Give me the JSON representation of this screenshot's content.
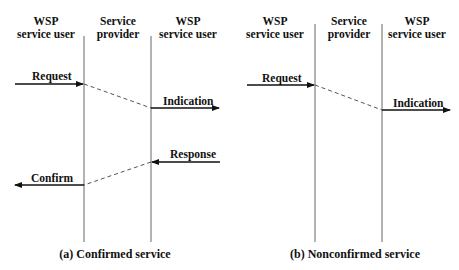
{
  "diagrams": [
    {
      "id": "a",
      "caption": "(a) Confirmed service",
      "columns": [
        {
          "line1": "WSP",
          "line2": "service user"
        },
        {
          "line1": "Service",
          "line2": "provider"
        },
        {
          "line1": "WSP",
          "line2": "service user"
        }
      ],
      "primitives": [
        {
          "label": "Request",
          "direction": "user-to-provider"
        },
        {
          "label": "Indication",
          "direction": "provider-to-user"
        },
        {
          "label": "Response",
          "direction": "user-to-provider"
        },
        {
          "label": "Confirm",
          "direction": "provider-to-user"
        }
      ]
    },
    {
      "id": "b",
      "caption": "(b) Nonconfirmed service",
      "columns": [
        {
          "line1": "WSP",
          "line2": "service user"
        },
        {
          "line1": "Service",
          "line2": "provider"
        },
        {
          "line1": "WSP",
          "line2": "service user"
        }
      ],
      "primitives": [
        {
          "label": "Request",
          "direction": "user-to-provider"
        },
        {
          "label": "Indication",
          "direction": "provider-to-user"
        }
      ]
    }
  ],
  "colors": {
    "line": "#555555",
    "arrow": "#111111",
    "background": "#ffffff"
  }
}
